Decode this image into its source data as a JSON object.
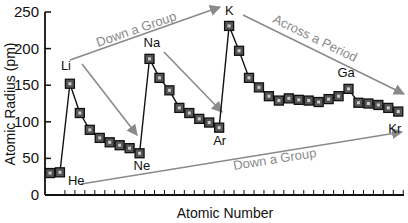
{
  "chart_data": {
    "type": "line",
    "title": "",
    "xlabel": "Atomic Number",
    "ylabel": "Atomic Radius (pm)",
    "ylim": [
      0,
      250
    ],
    "yticks": [
      0,
      50,
      100,
      150,
      200,
      250
    ],
    "grid": false,
    "legend": null,
    "x": [
      1,
      2,
      3,
      4,
      5,
      6,
      7,
      8,
      9,
      10,
      11,
      12,
      13,
      14,
      15,
      16,
      17,
      18,
      19,
      20,
      21,
      22,
      23,
      24,
      25,
      26,
      27,
      28,
      29,
      30,
      31,
      32,
      33,
      34,
      35,
      36
    ],
    "elements": [
      "H",
      "He",
      "Li",
      "Be",
      "B",
      "C",
      "N",
      "O",
      "F",
      "Ne",
      "Na",
      "Mg",
      "Al",
      "Si",
      "P",
      "S",
      "Cl",
      "Ar",
      "K",
      "Ca",
      "Sc",
      "Ti",
      "V",
      "Cr",
      "Mn",
      "Fe",
      "Co",
      "Ni",
      "Cu",
      "Zn",
      "Ga",
      "Ge",
      "As",
      "Se",
      "Br",
      "Kr"
    ],
    "values": [
      30,
      31,
      152,
      112,
      89,
      78,
      72,
      68,
      64,
      57,
      186,
      160,
      143,
      119,
      112,
      104,
      99,
      92,
      231,
      197,
      160,
      147,
      135,
      129,
      132,
      130,
      129,
      127,
      131,
      135,
      145,
      126,
      125,
      123,
      119,
      114
    ],
    "point_labels": [
      {
        "element": "He",
        "text": "He"
      },
      {
        "element": "Li",
        "text": "Li"
      },
      {
        "element": "Ne",
        "text": "Ne"
      },
      {
        "element": "Na",
        "text": "Na"
      },
      {
        "element": "Ar",
        "text": "Ar"
      },
      {
        "element": "K",
        "text": "K"
      },
      {
        "element": "Ga",
        "text": "Ga"
      },
      {
        "element": "Kr",
        "text": "Kr"
      }
    ],
    "annotations": [
      {
        "text": "Down a Group",
        "from": "Li",
        "to": "K",
        "position": "top"
      },
      {
        "text": "Across a Period",
        "from": "K",
        "to": "Kr",
        "position": "top-right"
      },
      {
        "text": "Down a Group",
        "from": "He",
        "to": "Kr",
        "position": "bottom"
      },
      {
        "text": "",
        "from": "Li",
        "to": "Ne",
        "position": "period-2-arrow"
      },
      {
        "text": "",
        "from": "Na",
        "to": "Ar",
        "position": "period-3-arrow"
      }
    ]
  },
  "colors": {
    "line": "#111111",
    "marker_fill": "#555555",
    "marker_center": "#cccccc",
    "arrow": "#8a8a8a",
    "axis": "#111111"
  }
}
